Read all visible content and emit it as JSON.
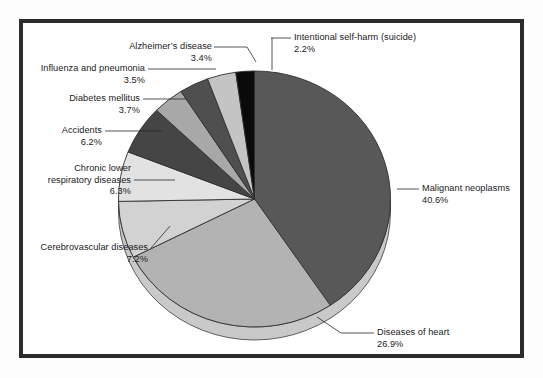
{
  "figure": {
    "frame_color": "#2c2c2c",
    "background": "#ffffff"
  },
  "chart_data": {
    "type": "pie",
    "title": "",
    "subtitle": "",
    "xlabel": "",
    "ylabel": "",
    "legend_position": "callout-labels",
    "grid": false,
    "units": "percent",
    "start_angle_deg": 0,
    "direction": "clockwise-for-first-slice",
    "categories": [
      "Malignant neoplasms",
      "Diseases of heart",
      "Cerebrovascular diseases",
      "Chronic lower respiratory diseases",
      "Accidents",
      "Diabetes mellitus",
      "Influenza and pneumonia",
      "Alzheimer's disease",
      "Intentional self-harm (suicide)"
    ],
    "values": [
      40.6,
      26.9,
      7.2,
      6.3,
      6.2,
      3.7,
      3.5,
      3.4,
      2.2
    ],
    "value_labels": [
      "40.6%",
      "26.9%",
      "7.2%",
      "6.3%",
      "6.2%",
      "3.7%",
      "3.5%",
      "3.4%",
      "2.2%"
    ],
    "colors": [
      "#585858",
      "#b3b3b3",
      "#d2d2d2",
      "#e2e2e2",
      "#454545",
      "#a8a8a8",
      "#4f4f4f",
      "#c4c4c4",
      "#0a0a0a"
    ],
    "slices": [
      {
        "name": "Malignant neoplasms",
        "value": 40.6,
        "label": "Malignant neoplasms",
        "pct_label": "40.6%",
        "color": "#585858"
      },
      {
        "name": "Diseases of heart",
        "value": 26.9,
        "label": "Diseases of heart",
        "pct_label": "26.9%",
        "color": "#b3b3b3"
      },
      {
        "name": "Cerebrovascular diseases",
        "value": 7.2,
        "label": "Cerebrovascular diseases",
        "pct_label": "7.2%",
        "color": "#d2d2d2"
      },
      {
        "name": "Chronic lower respiratory diseases",
        "value": 6.3,
        "label_line1": "Chronic lower",
        "label_line2": "respiratory diseases",
        "pct_label": "6.3%",
        "color": "#e2e2e2"
      },
      {
        "name": "Accidents",
        "value": 6.2,
        "label": "Accidents",
        "pct_label": "6.2%",
        "color": "#454545"
      },
      {
        "name": "Diabetes mellitus",
        "value": 3.7,
        "label": "Diabetes mellitus",
        "pct_label": "3.7%",
        "color": "#a8a8a8"
      },
      {
        "name": "Influenza and pneumonia",
        "value": 3.5,
        "label": "Influenza and pneumonia",
        "pct_label": "3.5%",
        "color": "#4f4f4f"
      },
      {
        "name": "Alzheimer's disease",
        "value": 3.4,
        "label": "Alzheimer’s disease",
        "pct_label": "3.4%",
        "color": "#c4c4c4"
      },
      {
        "name": "Intentional self-harm (suicide)",
        "value": 2.2,
        "label": "Intentional self-harm (suicide)",
        "pct_label": "2.2%",
        "color": "#0a0a0a"
      }
    ]
  }
}
